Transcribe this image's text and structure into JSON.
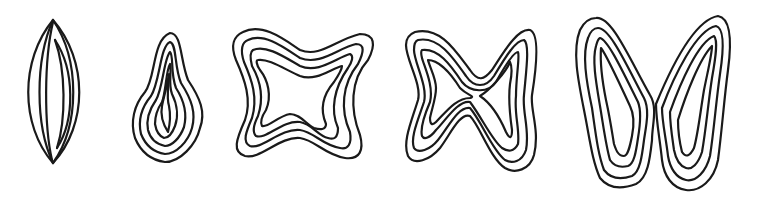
{
  "figure": {
    "background": "#ffffff",
    "ink_color": "#1a1a1a",
    "shapes": [
      {
        "id": "lens",
        "label": "lens-shaped outline with inner arcs"
      },
      {
        "id": "ovoid",
        "label": "irregular ovoid nested contours"
      },
      {
        "id": "four-lobed",
        "label": "four-lobed star nested contours"
      },
      {
        "id": "bowtie",
        "label": "bow-tie nested contours with pinched center"
      },
      {
        "id": "two-wing",
        "label": "two-winged nested contours joined at center"
      }
    ]
  }
}
